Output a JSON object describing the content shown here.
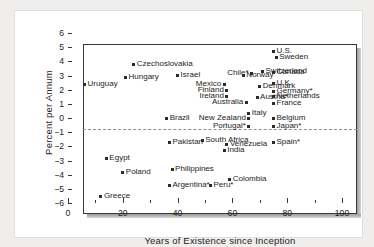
{
  "chart_data": {
    "type": "scatter",
    "title": "",
    "xlabel": "Years of Existence since Inception",
    "ylabel": "Percent per Annum",
    "xlim": [
      0,
      100
    ],
    "ylim": [
      -6,
      6
    ],
    "xticks": [
      0,
      20,
      40,
      60,
      80,
      100
    ],
    "yticks": [
      6,
      5,
      4,
      3,
      2,
      1,
      0,
      -1,
      -2,
      -3,
      -4,
      -5,
      -6
    ],
    "xtick_labels": [
      "0",
      "20",
      "40",
      "60",
      "80",
      "100"
    ],
    "ytick_labels": [
      "6",
      "5",
      "4",
      "3",
      "2",
      "1",
      "0",
      "−1",
      "−2",
      "−3",
      "−4",
      "−5",
      "−6"
    ],
    "grid": false,
    "legend": "none",
    "reference_line": {
      "y": 0,
      "style": "dashed",
      "color": "#8d8d8d"
    },
    "marker_color": "#2b2b2b",
    "points": [
      {
        "label": "Uruguay",
        "x": 6,
        "y": 2.4,
        "side": "right"
      },
      {
        "label": "Hungary",
        "x": 21,
        "y": 2.85,
        "side": "right"
      },
      {
        "label": "Czechoslovakia",
        "x": 24,
        "y": 3.8,
        "side": "right"
      },
      {
        "label": "Israel",
        "x": 40,
        "y": 3.0,
        "side": "right"
      },
      {
        "label": "Mexico",
        "x": 57,
        "y": 2.4,
        "side": "left"
      },
      {
        "label": "Finland",
        "x": 58,
        "y": 1.95,
        "side": "left"
      },
      {
        "label": "Ireland",
        "x": 58,
        "y": 1.55,
        "side": "left"
      },
      {
        "label": "Norway",
        "x": 64,
        "y": 3.0,
        "side": "right"
      },
      {
        "label": "Chile*",
        "x": 67,
        "y": 3.15,
        "side": "left"
      },
      {
        "label": "Denmark",
        "x": 70,
        "y": 2.2,
        "side": "right"
      },
      {
        "label": "Australia",
        "x": 65,
        "y": 1.1,
        "side": "left"
      },
      {
        "label": "Austria*",
        "x": 69,
        "y": 1.45,
        "side": "right"
      },
      {
        "label": "Italy",
        "x": 66,
        "y": 0.3,
        "side": "right"
      },
      {
        "label": "Switzerland",
        "x": 71,
        "y": 3.3,
        "side": "right"
      },
      {
        "label": "U.S.",
        "x": 75,
        "y": 4.7,
        "side": "right"
      },
      {
        "label": "Sweden",
        "x": 76,
        "y": 4.25,
        "side": "right"
      },
      {
        "label": "Canada",
        "x": 75,
        "y": 3.2,
        "side": "right"
      },
      {
        "label": "U.K.",
        "x": 75,
        "y": 2.45,
        "side": "right"
      },
      {
        "label": "Germany*",
        "x": 75,
        "y": 1.9,
        "side": "right"
      },
      {
        "label": "Netherlands",
        "x": 75,
        "y": 1.5,
        "side": "right"
      },
      {
        "label": "France",
        "x": 75,
        "y": 1.0,
        "side": "right"
      },
      {
        "label": "Belgium",
        "x": 75,
        "y": 0.0,
        "side": "right"
      },
      {
        "label": "Japan*",
        "x": 75,
        "y": -0.6,
        "side": "right"
      },
      {
        "label": "Spain*",
        "x": 75,
        "y": -1.7,
        "side": "right"
      },
      {
        "label": "Brazil",
        "x": 36,
        "y": 0.0,
        "side": "right"
      },
      {
        "label": "New Zealand",
        "x": 66,
        "y": 0.0,
        "side": "left"
      },
      {
        "label": "Portugal*",
        "x": 66,
        "y": -0.6,
        "side": "left"
      },
      {
        "label": "Pakistan",
        "x": 37,
        "y": -1.7,
        "side": "right"
      },
      {
        "label": "South Africa",
        "x": 49,
        "y": -1.6,
        "side": "right"
      },
      {
        "label": "Venezuela",
        "x": 58,
        "y": -1.9,
        "side": "right"
      },
      {
        "label": "India",
        "x": 57,
        "y": -2.3,
        "side": "right"
      },
      {
        "label": "Egypt",
        "x": 14,
        "y": -2.85,
        "side": "right"
      },
      {
        "label": "Poland",
        "x": 20,
        "y": -3.85,
        "side": "right"
      },
      {
        "label": "Philippines",
        "x": 38,
        "y": -3.6,
        "side": "right"
      },
      {
        "label": "Colombia",
        "x": 59,
        "y": -4.35,
        "side": "right"
      },
      {
        "label": "Argentina*",
        "x": 37,
        "y": -4.75,
        "side": "right"
      },
      {
        "label": "Peru*",
        "x": 52,
        "y": -4.75,
        "side": "right"
      },
      {
        "label": "Greece",
        "x": 12,
        "y": -5.55,
        "side": "right"
      }
    ]
  }
}
